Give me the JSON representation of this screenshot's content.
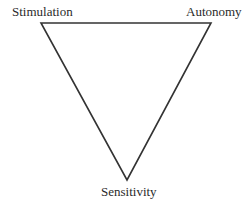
{
  "diagram": {
    "type": "inverted-triangle",
    "stroke_color": "#333333",
    "vertices": {
      "top_left": {
        "label": "Stimulation",
        "x": 41,
        "y": 23
      },
      "top_right": {
        "label": "Autonomy",
        "x": 211,
        "y": 23
      },
      "bottom": {
        "label": "Sensitivity",
        "x": 127,
        "y": 180
      }
    },
    "labels": {
      "top_left": "Stimulation",
      "top_right": "Autonomy",
      "bottom": "Sensitivity"
    }
  }
}
